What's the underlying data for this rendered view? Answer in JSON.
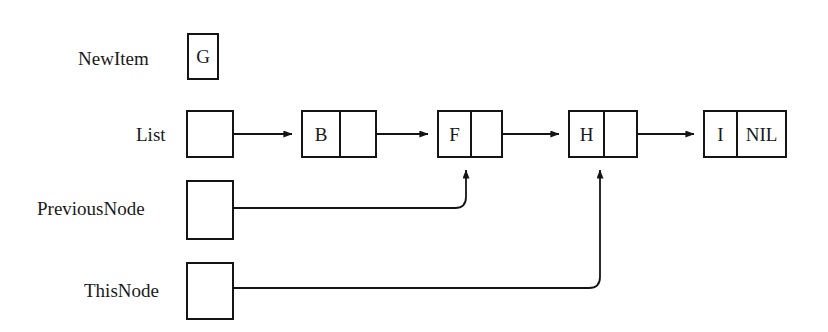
{
  "figure": {
    "background_color": "#ffffff",
    "ink_color": "#141414"
  },
  "pointers": [
    {
      "name": "newitem",
      "label": "NewItem",
      "label_x": 78,
      "label_y": 49,
      "box": {
        "x": 187,
        "y": 33,
        "width": 32,
        "height": 47
      },
      "value": "G",
      "has_outgoing_arrow": false
    },
    {
      "name": "list",
      "label": "List",
      "label_x": 136,
      "label_y": 125,
      "box": {
        "x": 186,
        "y": 110,
        "width": 48,
        "height": 48
      },
      "value": "",
      "has_outgoing_arrow": true
    },
    {
      "name": "previousnode",
      "label": "PreviousNode",
      "label_x": 37,
      "label_y": 199,
      "box": {
        "x": 186,
        "y": 180,
        "width": 48,
        "height": 60
      },
      "value": "",
      "has_outgoing_arrow": true
    },
    {
      "name": "thisnode",
      "label": "ThisNode",
      "label_x": 84,
      "label_y": 281,
      "box": {
        "x": 186,
        "y": 262,
        "width": 48,
        "height": 58
      },
      "value": "",
      "has_outgoing_arrow": true
    }
  ],
  "nodes": [
    {
      "name": "node-b",
      "data": "B",
      "link": "",
      "x": 301,
      "y": 110,
      "data_width": 36,
      "link_width": 36,
      "height": 48
    },
    {
      "name": "node-f",
      "data": "F",
      "link": "",
      "x": 437,
      "y": 110,
      "data_width": 31,
      "link_width": 31,
      "height": 48
    },
    {
      "name": "node-h",
      "data": "H",
      "link": "",
      "x": 568,
      "y": 110,
      "data_width": 33,
      "link_width": 33,
      "height": 48
    },
    {
      "name": "node-i",
      "data": "I",
      "link": "NIL",
      "x": 703,
      "y": 110,
      "data_width": 31,
      "link_width": 49,
      "height": 48
    }
  ],
  "connections": [
    {
      "name": "list-to-b",
      "from": "list",
      "to": "node-b",
      "style": "straight-arrow"
    },
    {
      "name": "b-to-f",
      "from": "node-b",
      "to": "node-f",
      "style": "straight-arrow"
    },
    {
      "name": "f-to-h",
      "from": "node-f",
      "to": "node-h",
      "style": "straight-arrow"
    },
    {
      "name": "h-to-i",
      "from": "node-h",
      "to": "node-i",
      "style": "straight-arrow"
    },
    {
      "name": "previousnode-to-f",
      "from": "previousnode",
      "to": "node-f",
      "style": "elbow-up-arrow"
    },
    {
      "name": "thisnode-to-h",
      "from": "thisnode",
      "to": "node-h",
      "style": "elbow-up-arrow"
    }
  ]
}
